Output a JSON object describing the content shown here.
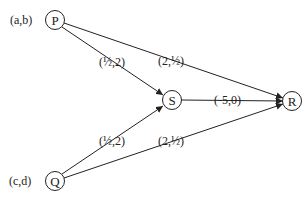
{
  "diagram": {
    "type": "directed-graph",
    "nodes": [
      {
        "id": "P",
        "label": "P",
        "x": 55,
        "y": 20,
        "annotation": "(a,b)"
      },
      {
        "id": "Q",
        "label": "Q",
        "x": 55,
        "y": 181,
        "annotation": "(c,d)"
      },
      {
        "id": "S",
        "label": "S",
        "x": 172,
        "y": 100,
        "annotation": ""
      },
      {
        "id": "R",
        "label": "R",
        "x": 292,
        "y": 101,
        "annotation": ""
      }
    ],
    "edges": [
      {
        "from": "P",
        "to": "S",
        "label": "(½,2)"
      },
      {
        "from": "P",
        "to": "R",
        "label": "(2,½)"
      },
      {
        "from": "Q",
        "to": "S",
        "label": "(½,2)"
      },
      {
        "from": "Q",
        "to": "R",
        "label": "(2,½)"
      },
      {
        "from": "S",
        "to": "R",
        "label": "(-5,0)"
      }
    ]
  },
  "colors": {
    "stroke": "#222222",
    "background": "#ffffff"
  }
}
